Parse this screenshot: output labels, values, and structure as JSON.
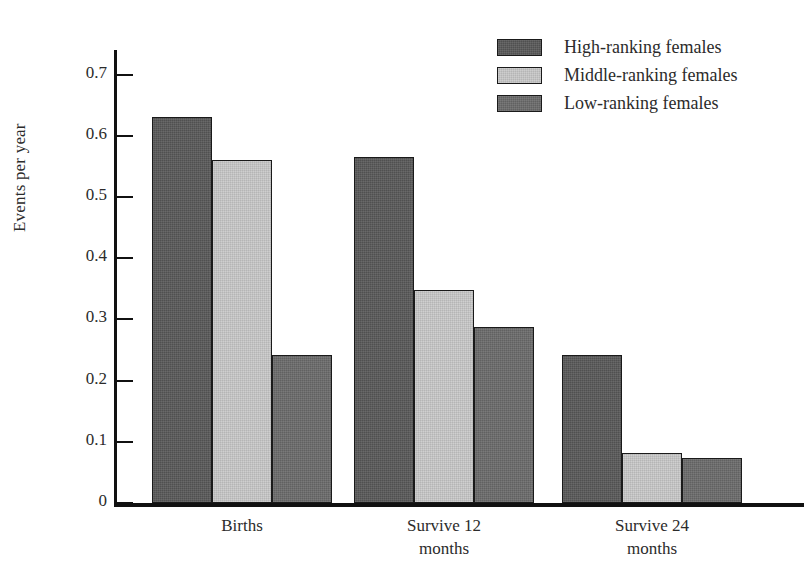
{
  "chart_data": {
    "type": "bar",
    "title": "",
    "xlabel": "",
    "ylabel": "Events per year",
    "ylim": [
      0,
      0.74
    ],
    "yticks": [
      0,
      0.1,
      0.2,
      0.3,
      0.4,
      0.5,
      0.6,
      0.7
    ],
    "ytick_labels": [
      "0",
      "0.1",
      "0.2",
      "0.3",
      "0.4",
      "0.5",
      "0.6",
      "0.7"
    ],
    "grid": false,
    "legend_position": "top-right",
    "categories": [
      "Births",
      "Survive 12 months",
      "Survive 24 months"
    ],
    "category_lines": [
      [
        "Births"
      ],
      [
        "Survive 12",
        "months"
      ],
      [
        "Survive 24",
        "months"
      ]
    ],
    "series": [
      {
        "name": "High-ranking females",
        "color": "#595959",
        "values": [
          0.63,
          0.565,
          0.241
        ]
      },
      {
        "name": "Middle-ranking females",
        "color": "#c9c9c9",
        "values": [
          0.56,
          0.348,
          0.082
        ]
      },
      {
        "name": "Low-ranking females",
        "color": "#6b6b6b",
        "values": [
          0.242,
          0.288,
          0.074
        ]
      }
    ]
  },
  "legend": {
    "items": [
      {
        "label": "High-ranking females",
        "swatch": "high"
      },
      {
        "label": "Middle-ranking females",
        "swatch": "mid"
      },
      {
        "label": "Low-ranking females",
        "swatch": "low"
      }
    ]
  },
  "colors": {
    "high_ranking": "#595959",
    "middle_ranking": "#c9c9c9",
    "low_ranking": "#6b6b6b",
    "axis": "#111111",
    "text": "#2b2b2b",
    "background": "#ffffff"
  }
}
